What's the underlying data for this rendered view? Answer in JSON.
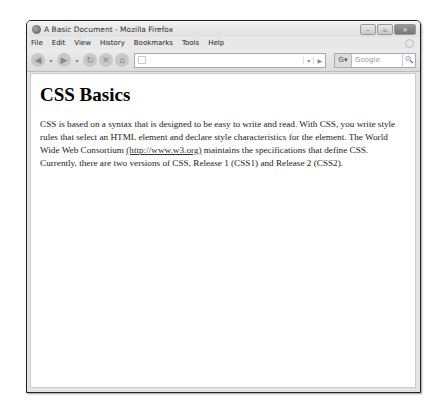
{
  "window": {
    "title": "A Basic Document - Mozilla Firefox",
    "controls": {
      "minimize": "–",
      "maximize": "▫",
      "close": "✕"
    }
  },
  "menubar": {
    "items": [
      "File",
      "Edit",
      "View",
      "History",
      "Bookmarks",
      "Tools",
      "Help"
    ]
  },
  "navbar": {
    "back_icon": "◀",
    "forward_icon": "▶",
    "reload_icon": "↻",
    "stop_icon": "✕",
    "home_icon": "⌂",
    "url_value": "",
    "dropdown_icon": "▾",
    "go_icon": "▶",
    "search_engine": "G▾",
    "search_placeholder": "Google",
    "search_icon": "🔍"
  },
  "page": {
    "heading": "CSS Basics",
    "paragraph_before_link": "CSS is based on a syntax that is designed to be easy to write and read. With CSS, you write style rules that select an HTML element and declare style characteristics for the element. The World Wide Web Consortium ",
    "link_text": "(http://www.w3.org)",
    "paragraph_after_link": " maintains the specifications that define CSS. Currently, there are two versions of CSS, Release 1 (CSS1) and Release 2 (CSS2)."
  }
}
